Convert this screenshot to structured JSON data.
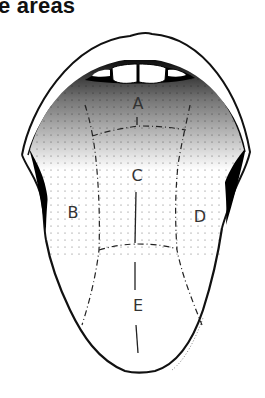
{
  "title": "e areas",
  "diagram": {
    "zones": [
      {
        "id": "A",
        "label": "A",
        "x": 138,
        "y": 109
      },
      {
        "id": "B",
        "label": "B",
        "x": 73,
        "y": 218
      },
      {
        "id": "C",
        "label": "C",
        "x": 137,
        "y": 181
      },
      {
        "id": "D",
        "label": "D",
        "x": 200,
        "y": 222
      },
      {
        "id": "E",
        "label": "E",
        "x": 138,
        "y": 311
      }
    ],
    "colors": {
      "outline": "#111111",
      "stipple": "#000000",
      "background": "#ffffff",
      "label": "#333333"
    }
  }
}
